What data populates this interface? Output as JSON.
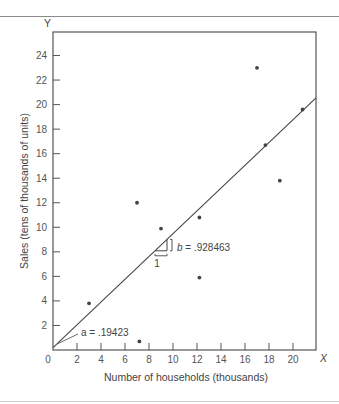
{
  "chart_data": {
    "type": "scatter",
    "title": "",
    "xlabel": "Number of households (thousands)",
    "ylabel": "Sales (tens of thousands of units)",
    "x_axis_letter": "X",
    "y_axis_letter": "Y",
    "origin_label": "0",
    "xlim": [
      0,
      22
    ],
    "ylim": [
      0,
      26
    ],
    "x_ticks": [
      2,
      4,
      6,
      8,
      10,
      12,
      14,
      16,
      18,
      20
    ],
    "y_ticks": [
      2,
      4,
      6,
      8,
      10,
      12,
      14,
      16,
      18,
      20,
      22,
      24
    ],
    "grid": false,
    "legend": null,
    "series": [
      {
        "name": "observations",
        "points": [
          {
            "x": 3.0,
            "y": 3.8
          },
          {
            "x": 7.0,
            "y": 12.0
          },
          {
            "x": 7.2,
            "y": 0.7
          },
          {
            "x": 9.0,
            "y": 9.9
          },
          {
            "x": 12.2,
            "y": 10.8
          },
          {
            "x": 12.2,
            "y": 5.9
          },
          {
            "x": 17.0,
            "y": 23.0
          },
          {
            "x": 17.7,
            "y": 16.7
          },
          {
            "x": 18.9,
            "y": 13.8
          },
          {
            "x": 20.8,
            "y": 19.6
          }
        ]
      }
    ],
    "regression_line": {
      "intercept": 0.19423,
      "slope": 0.928463,
      "x_range": [
        0,
        22
      ]
    },
    "annotations": {
      "intercept_label": "a  =  .19423",
      "slope_label_var": "b",
      "slope_label_value": " =  .928463",
      "slope_run_label": "1"
    }
  }
}
